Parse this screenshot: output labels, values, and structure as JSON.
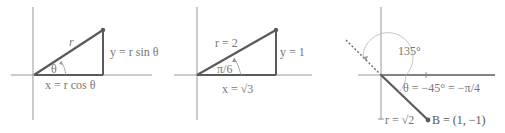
{
  "colors": {
    "axis": "#8a8a8a",
    "segment": "#5a5a5a",
    "label": "#7a7a7a",
    "arc": "#b5b5b5"
  },
  "panels": [
    {
      "id": "general",
      "labels": {
        "hypotenuse": "r",
        "opposite": "y = r sin θ",
        "angle": "θ",
        "adjacent": "x = r cos θ"
      }
    },
    {
      "id": "example",
      "labels": {
        "hypotenuse": "r = 2",
        "opposite": "y = 1",
        "angle": "π/6",
        "adjacent": "x = √3"
      }
    },
    {
      "id": "negative-angle",
      "labels": {
        "outer_angle": "135°",
        "angle": "θ = −45° = −π/4",
        "radius": "r = √2",
        "point": "B = (1, −1)"
      }
    }
  ]
}
